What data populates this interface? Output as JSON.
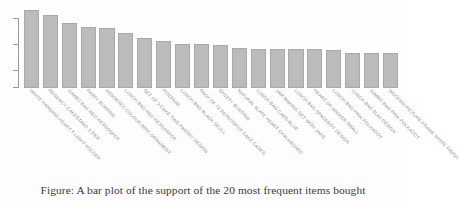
{
  "figure": {
    "caption": "Figure: A bar plot of the support of the 20 most frequent items bought",
    "bar_color": "#bcbcbc",
    "bar_border_color": "#a9a9a9",
    "axis_color": "#9a9a9a",
    "label_color": "#8c8c8c"
  },
  "chart_data": {
    "type": "bar",
    "title": "",
    "subtitle": "",
    "xlabel": "",
    "ylabel": "",
    "grid": false,
    "legend": false,
    "legend_position": "none",
    "axis_tick_labels_visible": false,
    "y_tick_count": 3,
    "orientation": "vertical",
    "categories": [
      "WHITE HANGING HEART T-LIGHT HOLDER",
      "REGENCY CAKESTAND 3 TIER",
      "JUMBO BAG RED RETROSPOT",
      "PARTY BUNTING",
      "ASSORTED COLOUR BIRD ORNAMENT",
      "LUNCH BAG RED RETROSPOT",
      "SET OF 3 CAKE TINS PANTRY DESIGN",
      "POSTAGE",
      "LUNCH BAG  BLACK SKULL.",
      "PACK OF 72 RETROSPOT CAKE CASES",
      "SPOTTY BUNTING",
      "NATURAL SLATE HEART CHALKBOARD",
      "LUNCH BAG CARS BLUE",
      "JAM MAKING SET WITH JARS",
      "LUNCH BAG SPACEBOY DESIGN",
      "HEART OF WICKER SMALL",
      "LUNCH BAG PINK POLKADOT",
      "LUNCH BAG SUKI DESIGN",
      "JUMBO BAG PINK POLKADOT",
      "WOODEN PICTURE FRAME WHITE FINISH"
    ],
    "values": [
      84,
      78,
      70,
      65,
      64,
      59,
      54,
      50,
      47,
      47,
      46,
      43,
      42,
      42,
      42,
      42,
      41,
      38,
      38,
      38
    ],
    "ylim": [
      0,
      90
    ],
    "value_unit": "support"
  }
}
